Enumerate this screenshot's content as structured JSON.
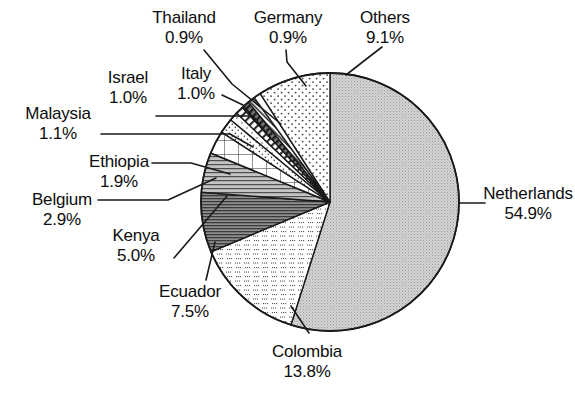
{
  "chart_data": {
    "type": "pie",
    "title": "",
    "subtitle": "",
    "xlabel": "",
    "ylabel": "",
    "legend_position": "callout-labels",
    "grid": false,
    "value_unit": "%",
    "start_angle_deg": -90,
    "direction": "clockwise",
    "categories": [
      "Netherlands",
      "Colombia",
      "Others",
      "Ecuador",
      "Kenya",
      "Belgium",
      "Ethiopia",
      "Malaysia",
      "Israel",
      "Italy",
      "Thailand",
      "Germany"
    ],
    "values": [
      54.9,
      13.8,
      9.1,
      7.5,
      5.0,
      2.9,
      1.9,
      1.1,
      1.0,
      1.0,
      0.9,
      0.9
    ],
    "slices": [
      {
        "name": "Netherlands",
        "percent": 54.9,
        "label": "Netherlands",
        "value_label": "54.9%",
        "pattern": "fine-stipple-gray",
        "fill": "#c9c9c9"
      },
      {
        "name": "Colombia",
        "percent": 13.8,
        "label": "Colombia",
        "value_label": "13.8%",
        "pattern": "sparse-dots",
        "fill": "#ffffff"
      },
      {
        "name": "Ecuador",
        "percent": 7.5,
        "label": "Ecuador",
        "value_label": "7.5%",
        "pattern": "dense-horizontal-lines-dark",
        "fill": "#9a9a9a"
      },
      {
        "name": "Kenya",
        "percent": 5.0,
        "label": "Kenya",
        "value_label": "5.0%",
        "pattern": "horizontal-lines",
        "fill": "#b5b5b5"
      },
      {
        "name": "Belgium",
        "percent": 2.9,
        "label": "Belgium",
        "value_label": "2.9%",
        "pattern": "grid-mesh",
        "fill": "#ffffff"
      },
      {
        "name": "Ethiopia",
        "percent": 1.9,
        "label": "Ethiopia",
        "value_label": "1.9%",
        "pattern": "fine-dots",
        "fill": "#ffffff"
      },
      {
        "name": "Malaysia",
        "percent": 1.1,
        "label": "Malaysia",
        "value_label": "1.1%",
        "pattern": "sparse-speckle",
        "fill": "#ffffff"
      },
      {
        "name": "Israel",
        "percent": 1.0,
        "label": "Israel",
        "value_label": "1.0%",
        "pattern": "diagonal-hatch",
        "fill": "#ffffff"
      },
      {
        "name": "Italy",
        "percent": 1.0,
        "label": "Italy",
        "value_label": "1.0%",
        "pattern": "cross-hatch-dark",
        "fill": "#6f6f6f"
      },
      {
        "name": "Thailand",
        "percent": 0.9,
        "label": "Thailand",
        "value_label": "0.9%",
        "pattern": "diagonal-hatch-dense",
        "fill": "#ffffff"
      },
      {
        "name": "Germany",
        "percent": 0.9,
        "label": "Germany",
        "value_label": "0.9%",
        "pattern": "solid-white",
        "fill": "#ffffff"
      },
      {
        "name": "Others",
        "percent": 9.1,
        "label": "Others",
        "value_label": "9.1%",
        "pattern": "regular-dots",
        "fill": "#ffffff"
      }
    ]
  },
  "labels": {
    "thailand": {
      "name": "Thailand",
      "percent": "0.9%"
    },
    "germany": {
      "name": "Germany",
      "percent": "0.9%"
    },
    "others": {
      "name": "Others",
      "percent": "9.1%"
    },
    "israel": {
      "name": "Israel",
      "percent": "1.0%"
    },
    "italy": {
      "name": "Italy",
      "percent": "1.0%"
    },
    "malaysia": {
      "name": "Malaysia",
      "percent": "1.1%"
    },
    "ethiopia": {
      "name": "Ethiopia",
      "percent": "1.9%"
    },
    "belgium": {
      "name": "Belgium",
      "percent": "2.9%"
    },
    "kenya": {
      "name": "Kenya",
      "percent": "5.0%"
    },
    "ecuador": {
      "name": "Ecuador",
      "percent": "7.5%"
    },
    "colombia": {
      "name": "Colombia",
      "percent": "13.8%"
    },
    "netherlands": {
      "name": "Netherlands",
      "percent": "54.9%"
    }
  },
  "colors": {
    "stroke": "#1a1a1a",
    "text": "#0d0d0d",
    "background": "#ffffff",
    "netherlands_fill": "#c9c9c9",
    "ecuador_fill": "#9a9a9a",
    "kenya_fill": "#b5b5b5"
  },
  "geometry": {
    "center_x": 330,
    "center_y": 202,
    "radius": 129
  }
}
